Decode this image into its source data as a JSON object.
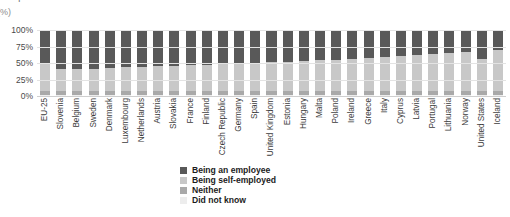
{
  "unit_label": "(%)",
  "clipped_title": {
    "left_fragment": "I",
    "right_fragment": ""
  },
  "legend": {
    "position": "bottom-center",
    "items": [
      {
        "label": "Being an employee",
        "color": "#595959",
        "key": "employee"
      },
      {
        "label": "Being self-employed",
        "color": "#c8c8c8",
        "key": "self_employed"
      },
      {
        "label": "Neither",
        "color": "#a9a9a9",
        "key": "neither"
      },
      {
        "label": "Did not know",
        "color": "#ededed",
        "key": "did_not_know"
      }
    ]
  },
  "chart_data": {
    "type": "bar",
    "stacked": true,
    "stack_total": 100,
    "orientation": "vertical",
    "title": "",
    "subtitle": "",
    "xlabel": "",
    "ylabel": "(%)",
    "ylim": [
      0,
      100
    ],
    "yticks": [
      0,
      25,
      50,
      75,
      100
    ],
    "ytick_labels": [
      "0%",
      "25%",
      "50%",
      "75%",
      "100%"
    ],
    "grid": true,
    "grid_axis": "y",
    "legend_entries": [
      "Being an employee",
      "Being self-employed",
      "Neither",
      "Did not know"
    ],
    "categories": [
      "EU-25",
      "Slovenia",
      "Belgium",
      "Sweden",
      "Denmark",
      "Luxembourg",
      "Netherlands",
      "Austria",
      "Slovakia",
      "France",
      "Finland",
      "Czech Republic",
      "Germany",
      "Spain",
      "United Kingdom",
      "Estonia",
      "Hungary",
      "Malta",
      "Poland",
      "Ireland",
      "Greece",
      "Italy",
      "Cyprus",
      "Latvia",
      "Portugal",
      "Lithuania",
      "Norway",
      "United States",
      "Iceland"
    ],
    "series": [
      {
        "name": "Being an employee",
        "color": "#595959",
        "values": [
          50,
          59,
          59,
          59,
          57,
          56,
          56,
          55,
          54,
          53,
          53,
          52,
          51,
          50,
          49,
          48,
          47,
          46,
          45,
          44,
          42,
          41,
          40,
          38,
          36,
          35,
          33,
          44,
          30
        ]
      },
      {
        "name": "Being self-employed",
        "color": "#c8c8c8",
        "values": [
          42,
          34,
          33,
          34,
          36,
          37,
          37,
          38,
          39,
          40,
          40,
          41,
          42,
          43,
          43,
          44,
          45,
          46,
          47,
          48,
          50,
          51,
          52,
          54,
          56,
          57,
          59,
          48,
          63
        ]
      },
      {
        "name": "Neither",
        "color": "#a9a9a9",
        "values": [
          6,
          5,
          6,
          5,
          5,
          5,
          5,
          5,
          5,
          5,
          5,
          5,
          5,
          5,
          6,
          6,
          6,
          6,
          6,
          6,
          6,
          6,
          6,
          6,
          6,
          6,
          6,
          6,
          5
        ]
      },
      {
        "name": "Did not know",
        "color": "#ededed",
        "values": [
          2,
          2,
          2,
          2,
          2,
          2,
          2,
          2,
          2,
          2,
          2,
          2,
          2,
          2,
          2,
          2,
          2,
          2,
          2,
          2,
          2,
          2,
          2,
          2,
          2,
          2,
          2,
          2,
          2
        ]
      }
    ]
  }
}
